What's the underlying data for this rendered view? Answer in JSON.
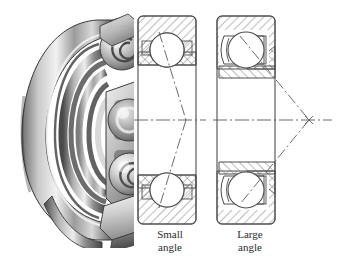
{
  "figure": {
    "type": "technical-illustration",
    "background_color": "#ffffff",
    "line_color": "#5a5a5a",
    "hatch_color": "#6b6b6b",
    "text_color": "#2b2b2b"
  },
  "photo": {
    "name": "bearing-cutaway-photograph",
    "description": "grayscale cutaway photograph of an angular contact ball bearing showing outer race, inner race, cage and balls",
    "tone_light": "#e8e8e8",
    "tone_mid": "#9a9a9a",
    "tone_dark": "#3d3d3d"
  },
  "diagrams": [
    {
      "id": "small-angle",
      "caption": "Small\nangle",
      "caption_line1": "Small",
      "caption_line2": "angle",
      "contact_angle_deg": 15,
      "apex_inside_bearing": true,
      "ball_count_shown": 2
    },
    {
      "id": "large-angle",
      "caption": "Large\nangle",
      "caption_line1": "Large",
      "caption_line2": "angle",
      "contact_angle_deg": 40,
      "apex_inside_bearing": false,
      "ball_count_shown": 2
    }
  ]
}
